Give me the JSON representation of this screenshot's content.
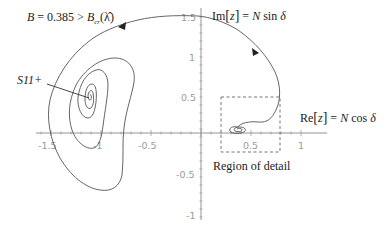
{
  "diagram": {
    "title_annotation": {
      "B": "B",
      "equals_value": " = 0.385 > ",
      "Bcr_main": "B",
      "Bcr_sub": "cr",
      "Bcr_arg": "(λ̂)"
    },
    "y_axis_label": {
      "prefix": "Im",
      "bracket_open": "[",
      "var": "z",
      "bracket_close": "]",
      "eq": " = ",
      "N": "N",
      "func": " sin ",
      "delta": "δ"
    },
    "x_axis_label": {
      "prefix": "Re",
      "bracket_open": "[",
      "var": "z",
      "bracket_close": "]",
      "eq": " = ",
      "N": "N",
      "func": " cos ",
      "delta": "δ"
    },
    "point_label": "S11+",
    "region_label": "Region of detail",
    "x_ticks": [
      "-1.5",
      "-1",
      "-0.5",
      "0.5",
      "1"
    ],
    "y_ticks": [
      "1.5",
      "1",
      "0.5",
      "-0.5",
      "-1"
    ],
    "axis_ranges": {
      "x": [
        -1.65,
        1.1
      ],
      "y": [
        -1.05,
        1.55
      ]
    },
    "region_of_detail_box": {
      "x": [
        0.2,
        0.79
      ],
      "y": [
        -0.24,
        0.45
      ]
    },
    "fixed_point_S11": {
      "x": -1.08,
      "y": 0.4
    },
    "colors": {
      "curve": "#555555",
      "axis": "#888888",
      "tick_label": "#9a9a9a",
      "text": "#222222"
    }
  }
}
